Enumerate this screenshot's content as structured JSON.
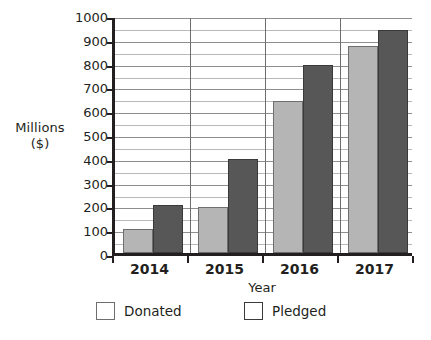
{
  "chart_data": {
    "type": "bar",
    "title": "",
    "xlabel": "Year",
    "ylabel_lines": [
      "Millions",
      "($)"
    ],
    "ylabel": "Millions ($)",
    "categories": [
      "2014",
      "2015",
      "2016",
      "2017"
    ],
    "series": [
      {
        "name": "Donated",
        "color": "#b5b5b5",
        "values": [
          100,
          195,
          640,
          870
        ]
      },
      {
        "name": "Pledged",
        "color": "#575757",
        "values": [
          200,
          395,
          790,
          935
        ]
      }
    ],
    "ylim": [
      0,
      1000
    ],
    "y_major_step": 100,
    "y_minor_step": 50,
    "y_tick_labels": [
      "0",
      "100",
      "200",
      "300",
      "400",
      "500",
      "600",
      "700",
      "800",
      "900",
      "1000"
    ],
    "grid": true,
    "grid_orientation": "horizontal",
    "group_separators": true,
    "legend_position": "bottom",
    "legend_entries": [
      "Donated",
      "Pledged"
    ]
  },
  "axes": {
    "y_title_line1": "Millions",
    "y_title_line2": "($)",
    "x_title": "Year"
  },
  "legend": {
    "donated_label": "Donated",
    "pledged_label": "Pledged",
    "donated_color": "#b5b5b5",
    "pledged_color": "#575757"
  }
}
